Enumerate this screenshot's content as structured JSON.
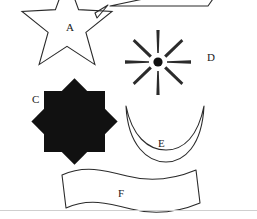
{
  "figure": {
    "width": 257,
    "height": 219,
    "background": "#ffffff",
    "stroke_color": "#2b2b2b",
    "fill_color": "#111111",
    "rule_color": "#cfcfcf",
    "shapes": [
      {
        "id": "shape-b",
        "label": "",
        "name": "trapezoid-partial",
        "style": "outline",
        "label_x": 0,
        "label_y": 0,
        "clipped": "top"
      },
      {
        "id": "shape-a",
        "label": "A",
        "name": "five-pointed-star",
        "style": "outline",
        "label_x": 66,
        "label_y": 22,
        "clipped": "top"
      },
      {
        "id": "shape-d",
        "label": "D",
        "name": "eight-ray-starburst",
        "style": "filled-rays",
        "label_x": 207,
        "label_y": 52,
        "rays": 8,
        "center_x": 158,
        "center_y": 62
      },
      {
        "id": "shape-c",
        "label": "C",
        "name": "eight-pointed-star-octagram",
        "style": "solid",
        "label_x": 32,
        "label_y": 94
      },
      {
        "id": "shape-e",
        "label": "E",
        "name": "crescent-bowl",
        "style": "outline",
        "label_x": 158,
        "label_y": 138
      },
      {
        "id": "shape-f",
        "label": "F",
        "name": "wavy-banner-ribbon",
        "style": "outline",
        "label_x": 118,
        "label_y": 188
      }
    ],
    "rule": {
      "y": 210
    }
  }
}
